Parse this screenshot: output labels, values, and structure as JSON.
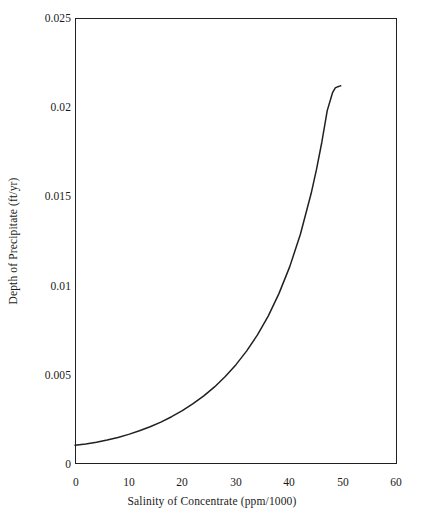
{
  "chart_data": {
    "type": "line",
    "title": "",
    "subtitle": "",
    "xlabel": "Salinity of Concentrate (ppm/1000)",
    "ylabel": "Depth of Precipitate (ft/yr)",
    "xlim": [
      0,
      60
    ],
    "ylim": [
      0,
      0.025
    ],
    "xticks": [
      0,
      10,
      20,
      30,
      40,
      50,
      60
    ],
    "xticklabels": [
      "0",
      "10",
      "20",
      "30",
      "40",
      "50",
      "60"
    ],
    "yticks": [
      0,
      0.005,
      0.01,
      0.015,
      0.02,
      0.025
    ],
    "yticklabels": [
      "0",
      "0.005",
      "0.01",
      "0.015",
      "0.02",
      "0.025"
    ],
    "grid": false,
    "legend": null,
    "legend_position": "none",
    "line_color": "#231f20",
    "line_width": 1.5,
    "series": [
      {
        "name": "Depth of Precipitate",
        "x": [
          0,
          2,
          4,
          6,
          8,
          10,
          12,
          14,
          16,
          18,
          20,
          22,
          24,
          26,
          28,
          30,
          32,
          34,
          36,
          38,
          40,
          42,
          44,
          45,
          46,
          47,
          48,
          48.5,
          49,
          49.3,
          49.5
        ],
        "y": [
          0.00105,
          0.00112,
          0.00122,
          0.00134,
          0.00149,
          0.00166,
          0.00186,
          0.00209,
          0.00235,
          0.00265,
          0.00299,
          0.00338,
          0.00382,
          0.00432,
          0.0049,
          0.00557,
          0.00634,
          0.00724,
          0.00829,
          0.00955,
          0.01105,
          0.01288,
          0.01516,
          0.01651,
          0.01805,
          0.01981,
          0.02082,
          0.02108,
          0.02115,
          0.02118,
          0.0212
        ]
      }
    ]
  },
  "axes": {
    "x_title": "Salinity of Concentrate (ppm/1000)",
    "y_title": "Depth of Precipitate (ft/yr)"
  }
}
